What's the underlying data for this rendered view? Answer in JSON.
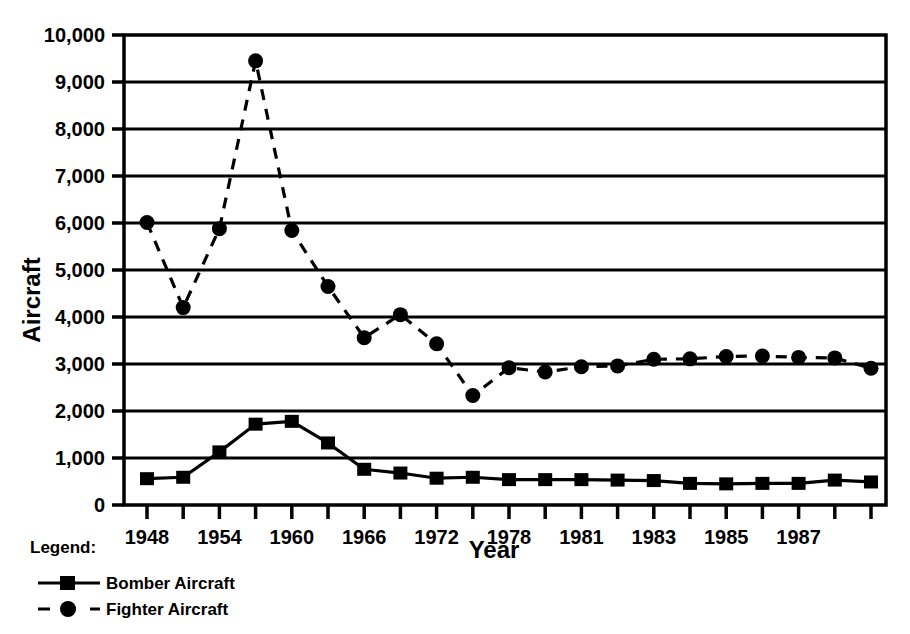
{
  "chart_data": {
    "type": "line",
    "title": "",
    "xlabel": "Year",
    "ylabel": "Aircraft",
    "ylim": [
      0,
      10000
    ],
    "ytick_values": [
      0,
      1000,
      2000,
      3000,
      4000,
      5000,
      6000,
      7000,
      8000,
      9000,
      10000
    ],
    "ytick_labels": [
      "0",
      "1,000",
      "2,000",
      "3,000",
      "4,000",
      "5,000",
      "6,000",
      "7,000",
      "8,000",
      "9,000",
      "10,000"
    ],
    "grid": true,
    "grid_axis": "y",
    "legend_position": "below-left",
    "x": [
      1948,
      1951,
      1954,
      1957,
      1960,
      1963,
      1966,
      1969,
      1972,
      1975,
      1978,
      1980,
      1981,
      1982,
      1983,
      1984,
      1985,
      1986,
      1987,
      1988,
      1989
    ],
    "xtick_labels": [
      "1948",
      "",
      "1954",
      "",
      "1960",
      "",
      "1966",
      "",
      "1972",
      "",
      "1978",
      "",
      "1981",
      "",
      "1983",
      "",
      "1985",
      "",
      "1987",
      "",
      ""
    ],
    "series": [
      {
        "name": "Bomber Aircraft",
        "marker": "square",
        "linestyle": "solid",
        "color": "#000000",
        "values": [
          560,
          590,
          1130,
          1720,
          1780,
          1320,
          760,
          680,
          570,
          590,
          540,
          540,
          540,
          530,
          520,
          460,
          450,
          460,
          460,
          530,
          490
        ]
      },
      {
        "name": "Fighter Aircraft",
        "marker": "circle",
        "linestyle": "dashed",
        "color": "#000000",
        "values": [
          6010,
          4200,
          5880,
          9450,
          5840,
          4650,
          3560,
          4050,
          3430,
          2330,
          2920,
          2830,
          2940,
          2960,
          3100,
          3110,
          3160,
          3170,
          3140,
          3130,
          2910
        ]
      }
    ]
  },
  "legend": {
    "title": "Legend:",
    "entries": [
      {
        "label": "Bomber Aircraft",
        "marker": "square",
        "linestyle": "solid"
      },
      {
        "label": "Fighter Aircraft",
        "marker": "circle",
        "linestyle": "dashed"
      }
    ]
  }
}
